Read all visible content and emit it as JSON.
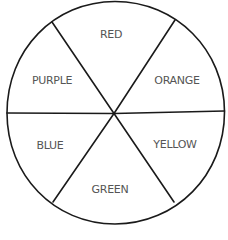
{
  "diagram": {
    "type": "color-wheel",
    "stroke_color": "#1a1a1a",
    "text_color": "#555555",
    "segments": [
      {
        "label": "RED",
        "position": "top"
      },
      {
        "label": "ORANGE",
        "position": "upper-right"
      },
      {
        "label": "YELLOW",
        "position": "lower-right"
      },
      {
        "label": "GREEN",
        "position": "bottom"
      },
      {
        "label": "BLUE",
        "position": "lower-left"
      },
      {
        "label": "PURPLE",
        "position": "upper-left"
      }
    ]
  }
}
